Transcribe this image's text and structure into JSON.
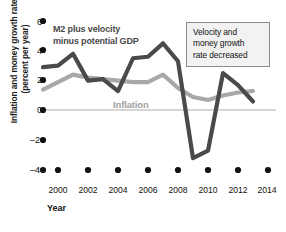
{
  "chart_data": {
    "type": "line",
    "title": "",
    "xlabel": "Year",
    "ylabel": "Inflation and money growth rates (percent per year)",
    "ylabel_line1": "Inflation and money growth rates",
    "ylabel_line2": "(percent per year)",
    "xlim": [
      1999,
      2014
    ],
    "ylim": [
      -4,
      6
    ],
    "yticks": [
      6,
      4,
      2,
      0,
      -2,
      -4
    ],
    "ytick_labels": [
      "6",
      "4",
      "2",
      "0",
      "–2",
      "–4"
    ],
    "xticks": [
      1999,
      2000,
      2002,
      2004,
      2006,
      2008,
      2010,
      2012,
      2014
    ],
    "xtick_labels": [
      "",
      "2000",
      "2002",
      "2004",
      "2006",
      "2008",
      "2010",
      "2012",
      "2014"
    ],
    "grid": false,
    "zero_line": true,
    "legend_position": "inline-labels",
    "x": [
      1999,
      2000,
      2001,
      2002,
      2003,
      2004,
      2005,
      2006,
      2007,
      2008,
      2009,
      2010,
      2011,
      2012,
      2013
    ],
    "series": [
      {
        "name": "M2 plus velocity minus potential GDP",
        "color": "#4a4a4a",
        "values": [
          2.9,
          3.0,
          3.8,
          2.0,
          2.1,
          1.3,
          3.5,
          3.6,
          4.5,
          3.3,
          -3.2,
          -2.7,
          2.5,
          1.7,
          0.6
        ]
      },
      {
        "name": "Inflation",
        "color": "#a8a8a8",
        "values": [
          1.4,
          1.9,
          2.4,
          2.2,
          2.1,
          2.0,
          1.9,
          1.9,
          2.4,
          1.5,
          0.9,
          0.7,
          1.0,
          1.2,
          1.3
        ]
      }
    ],
    "annotations": [
      {
        "name": "velocity-note",
        "lines": [
          "Velocity and",
          "money growth",
          "rate decreased"
        ],
        "text": "Velocity and money growth rate decreased"
      }
    ],
    "series_label_dark_line1": "M2 plus velocity",
    "series_label_dark_line2": "minus potential GDP",
    "series_label_gray": "Inflation"
  },
  "colors": {
    "dark_series": "#4a4a4a",
    "gray_series": "#a8a8a8",
    "zero_line": "#c9c9c9",
    "axis_dot": "#111111",
    "annotation_bg": "#f2f2f2",
    "annotation_border": "#8d8d8d",
    "background": "#ffffff"
  }
}
